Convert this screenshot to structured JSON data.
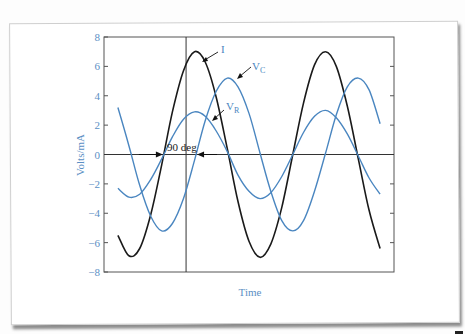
{
  "chart_data": {
    "type": "line",
    "title": "",
    "xlabel": "Time",
    "ylabel": "Volts/mA",
    "xlim": [
      0,
      1
    ],
    "ylim": [
      -8,
      8
    ],
    "yticks": [
      8,
      6,
      4,
      2,
      0,
      -2,
      -4,
      -6,
      -8
    ],
    "ytick_labels": [
      "8",
      "6",
      "4",
      "2",
      "0",
      "−2",
      "−4",
      "−6",
      "−8"
    ],
    "xticks": [],
    "grid": false,
    "legend": "none (inline arrow labels)",
    "reference_lines": {
      "horizontal_zero": 0,
      "vertical_time": 0.283
    },
    "x": [
      0.048,
      0.086,
      0.123,
      0.161,
      0.199,
      0.236,
      0.274,
      0.312,
      0.349,
      0.387,
      0.425,
      0.462,
      0.5,
      0.538,
      0.575,
      0.613,
      0.651,
      0.688,
      0.726,
      0.764,
      0.801,
      0.839,
      0.877,
      0.914,
      0.952
    ],
    "series": [
      {
        "name": "I",
        "label": "I",
        "color": "#1a1a1a",
        "amplitude": 7.0,
        "values": [
          -5.5,
          -6.9,
          -6.4,
          -4.1,
          -0.7,
          2.9,
          5.7,
          7.0,
          6.3,
          3.9,
          0.4,
          -3.2,
          -5.9,
          -7.0,
          -6.1,
          -3.6,
          0.0,
          3.5,
          6.1,
          7.0,
          6.0,
          3.3,
          -0.3,
          -3.8,
          -6.4
        ]
      },
      {
        "name": "V_C",
        "label": "V",
        "subscript": "C",
        "color": "#4a86c0",
        "amplitude": 5.2,
        "values": [
          3.2,
          0.6,
          -2.1,
          -4.2,
          -5.2,
          -4.7,
          -3.0,
          -0.4,
          2.3,
          4.3,
          5.2,
          4.6,
          2.8,
          0.1,
          -2.5,
          -4.5,
          -5.2,
          -4.5,
          -2.5,
          0.1,
          2.7,
          4.6,
          5.2,
          4.4,
          2.1
        ]
      },
      {
        "name": "V_R",
        "label": "V",
        "subscript": "R",
        "color": "#4a86c0",
        "amplitude": 2.95,
        "values": [
          -2.3,
          -2.9,
          -2.7,
          -1.7,
          -0.3,
          1.2,
          2.4,
          2.9,
          2.6,
          1.6,
          0.2,
          -1.4,
          -2.5,
          -3.0,
          -2.6,
          -1.5,
          0.0,
          1.5,
          2.6,
          3.0,
          2.5,
          1.4,
          -0.1,
          -1.6,
          -2.7
        ]
      }
    ],
    "annotations": [
      {
        "text": "90 deg",
        "type": "phase-shift",
        "from_x": 0.203,
        "to_x": 0.321,
        "y": 0
      },
      {
        "text": "I",
        "arrow_to": [
          0.338,
          6.4
        ]
      },
      {
        "text": "V_C",
        "arrow_to": [
          0.441,
          5.0
        ]
      },
      {
        "text": "V_R",
        "arrow_to": [
          0.372,
          2.2
        ]
      }
    ]
  },
  "labels": {
    "xlabel": "Time",
    "ylabel": "Volts/mA",
    "phase": "90 deg",
    "I": "I",
    "VC_main": "V",
    "VC_sub": "C",
    "VR_main": "V",
    "VR_sub": "R"
  }
}
